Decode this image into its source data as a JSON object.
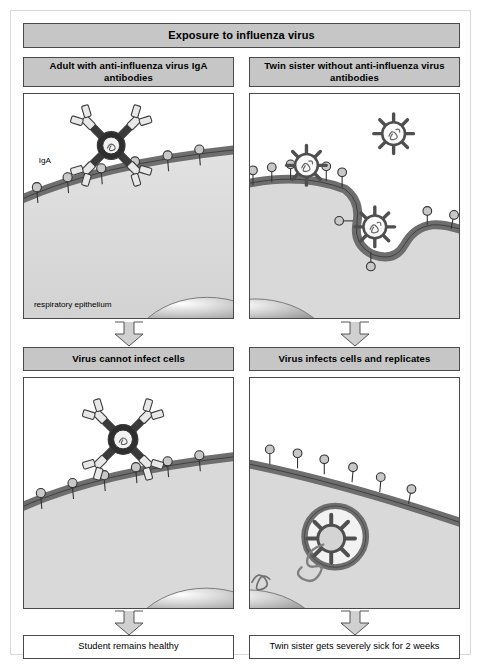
{
  "figure": {
    "title": "Exposure to influenza virus",
    "type": "biology-process-diagram"
  },
  "columns": {
    "left": {
      "header": "Adult with anti-influenza virus IgA antibodies",
      "mid_header": "Virus cannot infect cells",
      "outcome": "Student remains healthy"
    },
    "right": {
      "header": "Twin sister without anti-influenza virus antibodies",
      "mid_header": "Virus infects cells and replicates",
      "outcome": "Twin sister gets severely sick for 2 weeks"
    }
  },
  "scene_labels": {
    "iga": "IgA",
    "epithelium": "respiratory epithelium"
  },
  "colors": {
    "header_fill": "#c6c6c6",
    "border": "#4a4a4a",
    "membrane": "#6e6e6e",
    "cytoplasm": "#d9d9d9",
    "receptor_fill": "#c8c8c8",
    "virus_stroke": "#4f4f4f",
    "antibody_fill": "#e8e8e8",
    "page_background": "#ffffff",
    "arrow_fill": "#d0d0d0"
  },
  "icons": {
    "arrow": "down-arrow-icon",
    "virus": "influenza-virus-icon",
    "antibody": "iga-dimer-icon",
    "receptor": "sialic-acid-receptor-icon",
    "rna": "viral-rna-icon",
    "endosome": "endosome-icon",
    "nucleus": "nucleus-icon"
  },
  "scene_content": {
    "top_left": {
      "description": "Free polymeric IgA antibody above an intact respiratory epithelial cell surface bearing receptors",
      "virus_count": 0,
      "antibody_count": 1,
      "receptor_count": 6
    },
    "top_right": {
      "description": "Three influenza virus particles; one free, one docking on receptors, one engulfed by a membrane invagination",
      "virus_count": 3,
      "antibody_count": 0,
      "receptor_count": 9
    },
    "bottom_left": {
      "description": "IgA antibody has bound and neutralized the virus so it cannot reach the cell receptors",
      "virus_count": 1,
      "antibody_count": 1,
      "receptor_count": 6
    },
    "bottom_right": {
      "description": "Virus inside an endosome uncoating and releasing viral RNA, with RNA also present in the nucleus",
      "virus_count": 1,
      "antibody_count": 0,
      "receptor_count": 6
    }
  }
}
